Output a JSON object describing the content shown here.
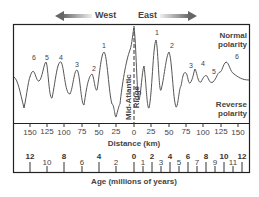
{
  "directions": {
    "west": "West",
    "east": "East"
  },
  "polarity": {
    "normal_line1": "Normal",
    "normal_line2": "polarity",
    "reverse_line1": "Reverse",
    "reverse_line2": "polarity"
  },
  "ridge": {
    "line1": "Mid-Atlantic",
    "line2": "Ridge"
  },
  "peaks": {
    "west": [
      "6",
      "5",
      "4",
      "3",
      "2",
      "1"
    ],
    "east": [
      "1",
      "2",
      "3",
      "4",
      "5",
      "6"
    ]
  },
  "distance_axis": {
    "title": "Distance (km)",
    "ticks": [
      "150",
      "125",
      "100",
      "75",
      "50",
      "25",
      "0",
      "25",
      "50",
      "75",
      "100",
      "125",
      "150"
    ]
  },
  "age_axis": {
    "title": "Age (millions of years)",
    "major_ticks_west": [
      "12",
      "8",
      "4"
    ],
    "minor_ticks_west": [
      "10",
      "6",
      "2"
    ],
    "major_ticks_east": [
      "0",
      "2",
      "4",
      "6",
      "8",
      "10",
      "12"
    ],
    "minor_ticks_east": [
      "1",
      "3",
      "5",
      "7",
      "9",
      "11"
    ]
  },
  "colors": {
    "line": "#555555",
    "frame": "#222222",
    "arrow": "#777777"
  }
}
